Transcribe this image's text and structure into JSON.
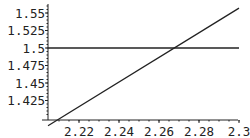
{
  "chart_data": {
    "type": "line",
    "title": "",
    "xlabel": "",
    "ylabel": "",
    "xlim": [
      2.2045,
      2.3
    ],
    "ylim": [
      1.397,
      1.56
    ],
    "x_origin": 2.2045,
    "y_origin": 1.397,
    "grid": false,
    "legend": null,
    "x_ticks": [
      2.22,
      2.24,
      2.26,
      2.28,
      2.3
    ],
    "x_tick_labels": [
      "2.22",
      "2.24",
      "2.26",
      "2.28",
      "2.3"
    ],
    "y_ticks": [
      1.425,
      1.45,
      1.475,
      1.5,
      1.525,
      1.55
    ],
    "y_tick_labels": [
      "1.425",
      "1.45",
      "1.475",
      "1.5",
      "1.525",
      "1.55"
    ],
    "series": [
      {
        "name": "increasing line",
        "x": [
          2.2045,
          2.3
        ],
        "y": [
          1.389,
          1.557
        ]
      },
      {
        "name": "constant line y=1.5",
        "x": [
          2.2045,
          2.3
        ],
        "y": [
          1.5,
          1.5
        ]
      }
    ],
    "annotations": [
      {
        "type": "intersection",
        "x": 2.2675,
        "y": 1.5
      }
    ]
  },
  "layout": {
    "plot_left_px": 48,
    "plot_right_px": 235,
    "axis_y_px": 120,
    "x_px_per_unit": 2000,
    "y_px_per_unit": 700,
    "y_ref_value": 1.5,
    "y_ref_px": 48,
    "x_ref_value": 2.22,
    "x_ref_px": 79
  }
}
